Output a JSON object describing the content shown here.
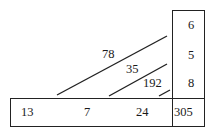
{
  "diagram": {
    "column_values": [
      "6",
      "5",
      "8"
    ],
    "corner_value": "305",
    "row_values": [
      "13",
      "7",
      "24"
    ],
    "diagonal_labels": [
      "78",
      "35",
      "192"
    ]
  }
}
